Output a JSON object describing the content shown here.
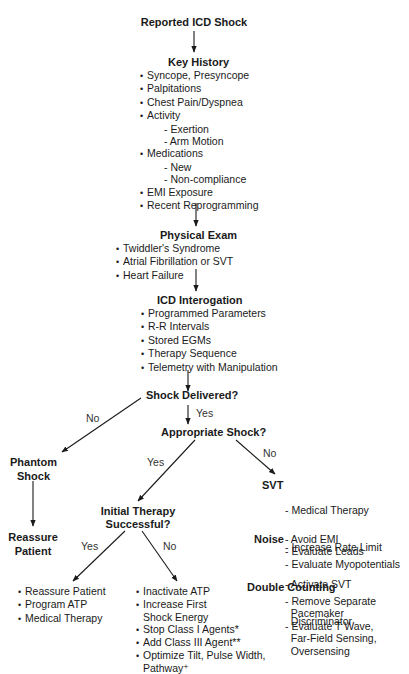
{
  "diagram": {
    "start": "Reported ICD Shock",
    "key_history": {
      "title": "Key History",
      "items": [
        {
          "type": "b",
          "text": "Syncope, Presyncope"
        },
        {
          "type": "b",
          "text": "Palpitations"
        },
        {
          "type": "b",
          "text": "Chest Pain/Dyspnea"
        },
        {
          "type": "b",
          "text": "Activity"
        },
        {
          "type": "d",
          "text": "Exertion"
        },
        {
          "type": "d",
          "text": "Arm Motion"
        },
        {
          "type": "b",
          "text": "Medications"
        },
        {
          "type": "d",
          "text": "New"
        },
        {
          "type": "d",
          "text": "Non-compliance"
        },
        {
          "type": "b",
          "text": "EMI Exposure"
        },
        {
          "type": "b",
          "text": "Recent Reprogramming"
        }
      ]
    },
    "physical_exam": {
      "title": "Physical Exam",
      "items": [
        "Twiddler's Syndrome",
        "Atrial Fibrillation or SVT",
        "Heart Failure"
      ]
    },
    "icd_interrogation": {
      "title": "ICD Interogation",
      "items": [
        "Programmed Parameters",
        "R-R Intervals",
        "Stored EGMs",
        "Therapy Sequence",
        "Telemetry with Manipulation"
      ]
    },
    "shock_delivered": {
      "question": "Shock Delivered?",
      "no": "No",
      "yes": "Yes"
    },
    "phantom_shock": {
      "line1": "Phantom",
      "line2": "Shock"
    },
    "reassure_patient": {
      "line1": "Reassure",
      "line2": "Patient"
    },
    "appropriate_shock": {
      "question": "Appropriate Shock?",
      "yes": "Yes",
      "no": "No"
    },
    "initial_therapy": {
      "line1": "Initial Therapy",
      "line2": "Successful?",
      "yes": "Yes",
      "no": "No"
    },
    "success_actions": [
      "Reassure Patient",
      "Program ATP",
      "Medical Therapy"
    ],
    "failure_actions": [
      {
        "type": "b",
        "text": "Inactivate ATP"
      },
      {
        "type": "b",
        "text": "Increase First"
      },
      {
        "type": "c",
        "text": "Shock Energy"
      },
      {
        "type": "b",
        "text": "Stop Class I Agents*"
      },
      {
        "type": "b",
        "text": "Add Class III Agent**"
      },
      {
        "type": "b",
        "text": "Optimize Tilt, Pulse Width,"
      },
      {
        "type": "c",
        "text": "Pathway⁺"
      }
    ],
    "svt": {
      "label": "SVT",
      "items": [
        "- Medical Therapy",
        "- Increase Rate Limit",
        "- Activate SVT",
        "  Discriminator"
      ]
    },
    "noise": {
      "label": "Noise",
      "items": [
        "- Avoid EMI",
        "- Evaluate Leads",
        "- Evaluate Myopotentials"
      ]
    },
    "double_counting": {
      "label": "Double Counting",
      "items": [
        "- Remove Separate",
        "  Pacemaker",
        "- Evaluate T Wave,",
        "  Far-Field Sensing,",
        "  Oversensing"
      ]
    }
  },
  "colors": {
    "line": "#1a1a1a",
    "text": "#1a1a1a",
    "background": "#ffffff"
  }
}
